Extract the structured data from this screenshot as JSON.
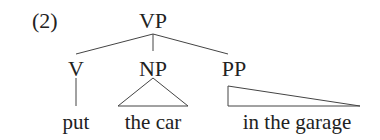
{
  "example_number": "(2)",
  "tree": {
    "root": "VP",
    "children": [
      {
        "label": "V",
        "leaf": "put",
        "leaf_style": "line"
      },
      {
        "label": "NP",
        "leaf": "the car",
        "leaf_style": "triangle"
      },
      {
        "label": "PP",
        "leaf": "in the garage",
        "leaf_style": "triangle"
      }
    ]
  }
}
